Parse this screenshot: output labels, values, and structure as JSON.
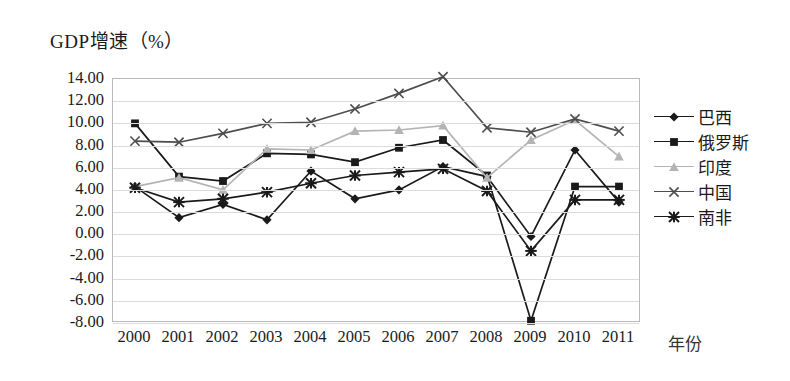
{
  "chart_data": {
    "type": "line",
    "title": "GDP增速（%）",
    "xlabel": "年份",
    "ylabel": "",
    "grid": true,
    "legend_position": "right",
    "ylim": [
      -8,
      14
    ],
    "yticks": [
      "14.00",
      "12.00",
      "10.00",
      "8.00",
      "6.00",
      "4.00",
      "2.00",
      "0.00",
      "-2.00",
      "-4.00",
      "-6.00",
      "-8.00"
    ],
    "categories": [
      "2000",
      "2001",
      "2002",
      "2003",
      "2004",
      "2005",
      "2006",
      "2007",
      "2008",
      "2009",
      "2010",
      "2011"
    ],
    "series": [
      {
        "name": "巴西",
        "marker": "diamond",
        "color": "#1a1a1a",
        "values": [
          4.3,
          1.5,
          2.7,
          1.3,
          5.7,
          3.2,
          4.0,
          6.1,
          5.2,
          -0.2,
          7.6,
          2.9
        ]
      },
      {
        "name": "俄罗斯",
        "marker": "square",
        "color": "#1a1a1a",
        "values": [
          10.0,
          5.2,
          4.8,
          7.3,
          7.2,
          6.5,
          7.8,
          8.5,
          5.3,
          -7.8,
          4.3,
          4.3
        ]
      },
      {
        "name": "印度",
        "marker": "triangle",
        "color": "#b4b4b4",
        "values": [
          4.3,
          5.1,
          4.0,
          7.7,
          7.6,
          9.3,
          9.4,
          9.8,
          5.1,
          8.5,
          10.3,
          7.0
        ]
      },
      {
        "name": "中国",
        "marker": "cross",
        "color": "#4d4d4d",
        "values": [
          8.4,
          8.3,
          9.1,
          10.0,
          10.1,
          11.3,
          12.7,
          14.2,
          9.6,
          9.2,
          10.4,
          9.3
        ]
      },
      {
        "name": "南非",
        "marker": "asterisk",
        "color": "#1a1a1a",
        "values": [
          4.2,
          2.9,
          3.2,
          3.8,
          4.6,
          5.3,
          5.6,
          5.9,
          3.9,
          -1.5,
          3.1,
          3.1
        ]
      }
    ]
  }
}
